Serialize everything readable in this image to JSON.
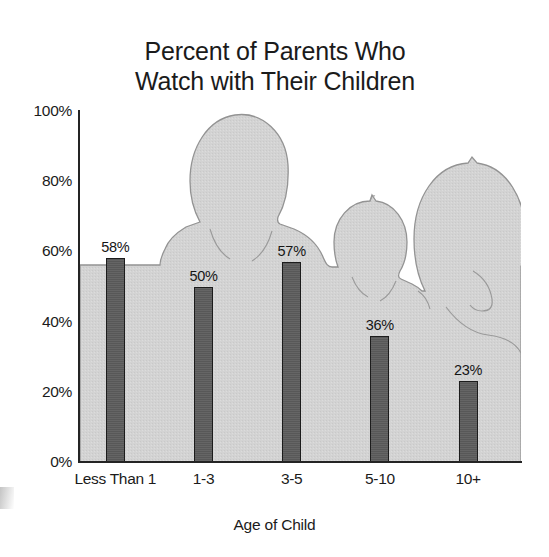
{
  "chart_data": {
    "type": "bar",
    "title": "Percent of Parents Who Watch with Their Children",
    "title_lines": [
      "Percent of Parents Who",
      "Watch with Their Children"
    ],
    "categories": [
      "Less Than 1",
      "1-3",
      "3-5",
      "5-10",
      "10+"
    ],
    "values": [
      58,
      50,
      57,
      36,
      23
    ],
    "value_labels": [
      "58%",
      "50%",
      "57%",
      "36%",
      "23%"
    ],
    "xlabel": "Age of Child",
    "ylabel": "",
    "ylim": [
      0,
      100
    ],
    "ytick_labels": [
      "100%",
      "80%",
      "60%",
      "40%",
      "20%",
      "0%"
    ],
    "ytick_values": [
      100,
      80,
      60,
      40,
      20,
      0
    ],
    "grid": false,
    "legend": null,
    "bar_color": "#5d5d5d",
    "bar_outline_color": "#1c1c1c",
    "background_image": "family-silhouette",
    "background_color": "#d3d3d3",
    "axis_color": "#242424",
    "text_color": "#1b1b1b"
  },
  "background": {
    "description": "gray family silhouette (father, child, mother) behind the plot area",
    "fill": "#d2d2d2",
    "stroke": "#8d8d8d"
  }
}
